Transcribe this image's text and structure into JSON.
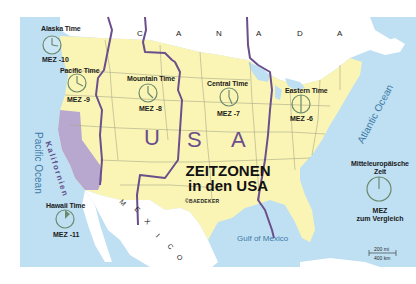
{
  "map": {
    "title_line1": "ZEITZONEN",
    "title_line2": "in den USA",
    "publisher": "©BAEDEKER",
    "colors": {
      "ocean": "#bfe0f2",
      "usa_land": "#fbf5b5",
      "foreign_land": "#ffffff",
      "california": "#b8a8d0",
      "zone_border": "#6b4e8c",
      "state_border": "#a8a78a",
      "clock": "#6b8a6e"
    },
    "country_labels": {
      "canada": [
        "C",
        "A",
        "N",
        "A",
        "D",
        "A"
      ],
      "usa": [
        "U",
        "S",
        "A"
      ],
      "mexico": [
        "M",
        "E",
        "X",
        "I",
        "C",
        "O"
      ]
    },
    "region_label": "Kalifornien",
    "water_labels": {
      "pacific": "Pacific Ocean",
      "atlantic": "Atlantic Ocean",
      "gulf": "Gulf of Mexico"
    },
    "time_zones": [
      {
        "name": "Alaska Time",
        "offset": "MEZ -10"
      },
      {
        "name": "Pacific Time",
        "offset": "MEZ -9"
      },
      {
        "name": "Mountain Time",
        "offset": "MEZ -8"
      },
      {
        "name": "Central Time",
        "offset": "MEZ -7"
      },
      {
        "name": "Eastern Time",
        "offset": "MEZ -6"
      },
      {
        "name": "Hawaii Time",
        "offset": "MEZ -11"
      }
    ],
    "reference": {
      "title_line1": "Mitteleuropäische",
      "title_line2": "Zeit",
      "label_line1": "MEZ",
      "label_line2": "zum Vergleich"
    },
    "scale": {
      "miles": "200 mi",
      "km": "400 km"
    }
  }
}
